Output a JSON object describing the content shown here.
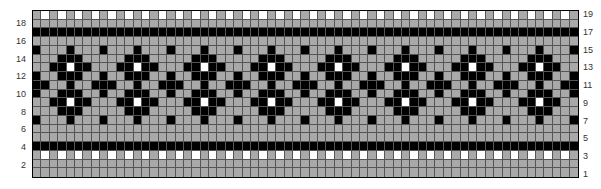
{
  "chart": {
    "columns": 65,
    "rows": 19,
    "repeat_width": 8,
    "colors": {
      "B": "#000000",
      "G": "#a9a9a9",
      "W": "#ffffff"
    },
    "legend": {
      "B": "black stitch",
      "G": "gray (background) stitch",
      "W": "white stitch"
    },
    "row_labels_left": [
      "18",
      "16",
      "14",
      "12",
      "10",
      "8",
      "6",
      "4",
      "2"
    ],
    "row_labels_right": [
      "19",
      "17",
      "15",
      "13",
      "11",
      "9",
      "7",
      "5",
      "3",
      "1"
    ],
    "repeat_rows": {
      "19": "GWGWGWGW",
      "18": "GGGGGGGG",
      "17": "BBBBBBBB",
      "16": "GGGGGGGG",
      "15": "BGGGBGGG",
      "14": "GGGBBBGG",
      "13": "GGBBWBBG",
      "12": "BGGBBBGG",
      "11": "BBGGBGGB",
      "10": "BGGBBBGG",
      "9": "GGBBWBBG",
      "8": "GGGBBBGG",
      "7": "BGGGBGGG",
      "6": "GGGGGGGG",
      "5": "GGGGGGGG",
      "4": "BBBBBBBB",
      "3": "GWGWGWGW",
      "2": "GGGGGGGG",
      "1": "GGGGGGGG"
    }
  },
  "chart_data": {
    "type": "heatmap",
    "title": "",
    "xlabel": "",
    "ylabel": "Row",
    "rows": 19,
    "columns": 65,
    "y_ticks_left": [
      18,
      16,
      14,
      12,
      10,
      8,
      6,
      4,
      2
    ],
    "y_ticks_right": [
      19,
      17,
      15,
      13,
      11,
      9,
      7,
      5,
      3,
      1
    ],
    "values_legend": {
      "B": "black",
      "G": "gray",
      "W": "white"
    },
    "motif": "8-stitch repeat diamond band with white centers, bordered by solid black rows 4 and 17 and white-dotted rows 3 and 19",
    "grid": true
  }
}
